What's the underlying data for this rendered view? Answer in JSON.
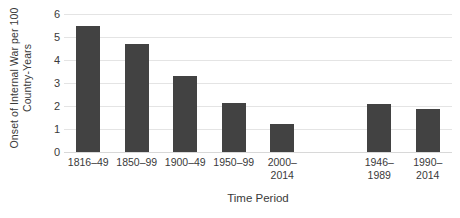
{
  "chart_data": {
    "type": "bar",
    "title": "",
    "subtitle": "",
    "xlabel": "Time Period",
    "ylabel": "Onset of Internal War per 100 Country-Years",
    "categories": [
      "1816–49",
      "1850–99",
      "1900–49",
      "1950–99",
      "2000–\n2014",
      "",
      "1946–\n1989",
      "1990–\n2014"
    ],
    "values": [
      5.5,
      4.7,
      3.3,
      2.15,
      1.2,
      null,
      2.1,
      1.85
    ],
    "ylim": [
      0,
      6
    ],
    "yticks": [
      0,
      1,
      2,
      3,
      4,
      5,
      6
    ],
    "ytick_labels": [
      "0",
      "1",
      "2",
      "3",
      "4",
      "5",
      "6"
    ],
    "grid": true,
    "legend": "none",
    "bar_color": "#424242",
    "gridline_color": "#e4e4e4",
    "background_color": "#ffffff",
    "text_color": "#3a3a3a"
  }
}
